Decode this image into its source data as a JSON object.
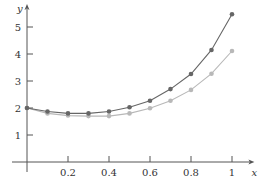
{
  "chart_data": {
    "type": "line",
    "title": "",
    "xlabel": "x",
    "ylabel": "y",
    "xlim": [
      0,
      1.08
    ],
    "ylim": [
      0,
      5.6
    ],
    "grid": false,
    "legend": null,
    "x": [
      0,
      0.1,
      0.2,
      0.3,
      0.4,
      0.5,
      0.6,
      0.7,
      0.8,
      0.9,
      1.0
    ],
    "x_ticks": [
      0.2,
      0.4,
      0.6,
      0.8,
      1
    ],
    "x_tick_labels": [
      "0.2",
      "0.4",
      "0.6",
      "0.8",
      "1"
    ],
    "y_ticks": [
      1,
      2,
      3,
      4,
      5
    ],
    "y_tick_labels": [
      "1",
      "2",
      "3",
      "4",
      "5"
    ],
    "series": [
      {
        "name": "dark",
        "color": "#666666",
        "values": [
          2.0,
          1.87,
          1.8,
          1.8,
          1.87,
          2.03,
          2.27,
          2.7,
          3.26,
          4.15,
          5.47
        ]
      },
      {
        "name": "light",
        "color": "#b8b8b8",
        "values": [
          2.0,
          1.8,
          1.72,
          1.7,
          1.7,
          1.8,
          1.99,
          2.27,
          2.67,
          3.27,
          4.11
        ]
      }
    ]
  },
  "layout": {
    "origin_px": [
      27,
      162
    ],
    "x_px_per_unit": 205,
    "y_px_per_unit": 27,
    "axis_color": "#555555"
  }
}
